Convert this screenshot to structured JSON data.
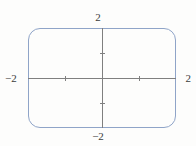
{
  "figure": {
    "name": "coordinate-graph",
    "background_color": "#fdfdfc"
  },
  "labels": {
    "top": "2",
    "bottom": "−2",
    "left": "−2",
    "right": "2"
  },
  "colors": {
    "curve": "#8fa4c8",
    "axis": "#7f7f7f",
    "text": "#3b3b3b",
    "background": "#fdfdfc"
  },
  "chart_data": {
    "type": "line",
    "title": "",
    "xlabel": "",
    "ylabel": "",
    "xlim": [
      -2,
      2
    ],
    "ylim": [
      -2,
      2
    ],
    "grid": false,
    "legend": null,
    "axis_tick_labels": {
      "x": [
        "−2",
        "2"
      ],
      "y": [
        "−2",
        "2"
      ]
    },
    "axis_ticks": {
      "x": [
        -1,
        1
      ],
      "y": [
        -1,
        1
      ]
    },
    "series": [
      {
        "name": "rounded-rectangle-curve",
        "color": "#8fa4c8",
        "closed": true,
        "description": "Closed curve forming a rectangle with rounded corners spanning nearly the full viewing window",
        "x": [
          -1.9,
          1.9,
          1.9,
          -1.9,
          -1.9
        ],
        "y": [
          1.85,
          1.85,
          -1.85,
          -1.85,
          1.85
        ]
      }
    ]
  }
}
